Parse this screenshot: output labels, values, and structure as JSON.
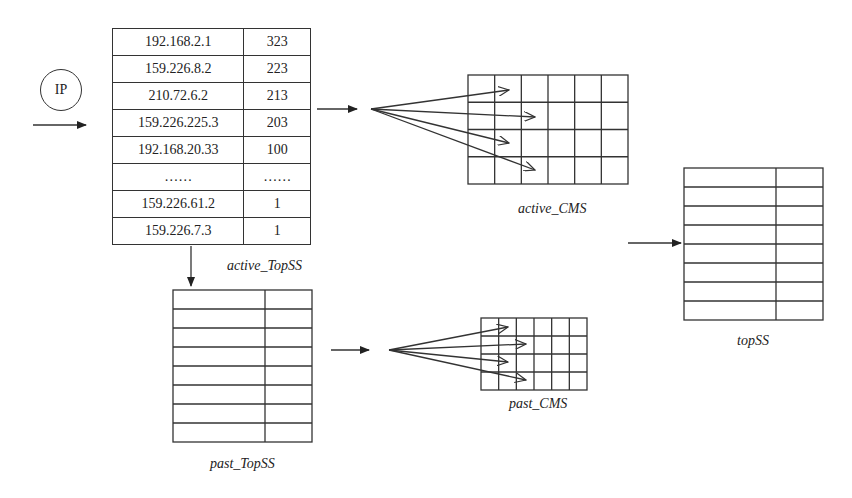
{
  "input": {
    "label": "IP"
  },
  "active_topss": {
    "label": "active_TopSS",
    "rows": [
      {
        "ip": "192.168.2.1",
        "count": "323"
      },
      {
        "ip": "159.226.8.2",
        "count": "223"
      },
      {
        "ip": "210.72.6.2",
        "count": "213"
      },
      {
        "ip": "159.226.225.3",
        "count": "203"
      },
      {
        "ip": "192.168.20.33",
        "count": "100"
      },
      {
        "ip": "……",
        "count": "……"
      },
      {
        "ip": "159.226.61.2",
        "count": "1"
      },
      {
        "ip": "159.226.7.3",
        "count": "1"
      }
    ]
  },
  "active_cms": {
    "label": "active_CMS",
    "columns": 6,
    "rows": 4
  },
  "past_topss": {
    "label": "past_TopSS",
    "rows": 8
  },
  "past_cms": {
    "label": "past_CMS",
    "columns": 6,
    "rows": 4
  },
  "topss": {
    "label": "topSS",
    "rows": 8
  },
  "colors": {
    "line": "#333333",
    "background": "#ffffff",
    "text": "#222222"
  }
}
